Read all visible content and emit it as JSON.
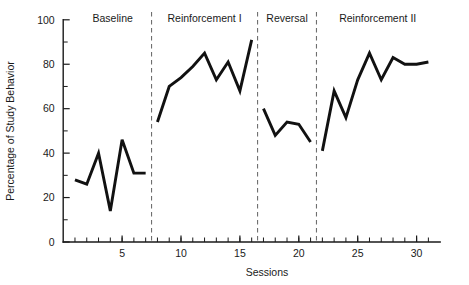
{
  "chart_data": {
    "type": "line",
    "title": "",
    "xlabel": "Sessions",
    "ylabel": "Percentage of Study Behavior",
    "xlim": [
      0.3,
      31.8
    ],
    "ylim": [
      0,
      100
    ],
    "grid": false,
    "legend": "none",
    "y_ticks": [
      0,
      20,
      40,
      60,
      80,
      100
    ],
    "y_tick_labels": [
      "0",
      "20",
      "40",
      "60",
      "80",
      "100"
    ],
    "y_minor_ticks": [
      10,
      30,
      50,
      70,
      90
    ],
    "x_ticks": [
      1,
      2,
      3,
      4,
      5,
      6,
      7,
      8,
      9,
      10,
      11,
      12,
      13,
      14,
      15,
      16,
      17,
      18,
      19,
      20,
      21,
      22,
      23,
      24,
      25,
      26,
      27,
      28,
      29,
      30,
      31
    ],
    "x_tick_labels": [
      {
        "value": 5,
        "label": "5"
      },
      {
        "value": 10,
        "label": "10"
      },
      {
        "value": 15,
        "label": "15"
      },
      {
        "value": 20,
        "label": "20"
      },
      {
        "value": 25,
        "label": "25"
      },
      {
        "value": 30,
        "label": "30"
      }
    ],
    "phases": [
      {
        "name": "Baseline",
        "label_x": 4.2,
        "start": 1,
        "end": 7
      },
      {
        "name": "Reinforcement I",
        "label_x": 12.0,
        "start": 8,
        "end": 16
      },
      {
        "name": "Reversal",
        "label_x": 19.0,
        "start": 17,
        "end": 21
      },
      {
        "name": "Reinforcement II",
        "label_x": 26.7,
        "start": 22,
        "end": 31
      }
    ],
    "phase_dividers": [
      7.5,
      16.5,
      21.5
    ],
    "series": [
      {
        "name": "Percentage of Study Behavior",
        "color": "#111111",
        "segments": [
          {
            "phase": "Baseline",
            "x": [
              1,
              2,
              3,
              4,
              5,
              6,
              7
            ],
            "values": [
              28,
              26,
              40,
              14,
              46,
              31,
              31
            ]
          },
          {
            "phase": "Reinforcement I",
            "x": [
              8,
              9,
              10,
              11,
              12,
              13,
              14,
              15,
              16
            ],
            "values": [
              54,
              70,
              74,
              79,
              85,
              73,
              81,
              68,
              91
            ]
          },
          {
            "phase": "Reversal",
            "x": [
              17,
              18,
              19,
              20,
              21
            ],
            "values": [
              60,
              48,
              54,
              53,
              45
            ]
          },
          {
            "phase": "Reinforcement II",
            "x": [
              22,
              23,
              24,
              25,
              26,
              27,
              28,
              29,
              30,
              31
            ],
            "values": [
              41,
              68,
              56,
              73,
              85,
              73,
              83,
              80,
              80,
              81
            ]
          }
        ]
      }
    ]
  }
}
